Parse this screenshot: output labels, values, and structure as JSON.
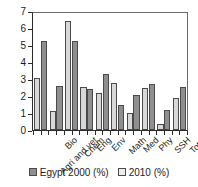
{
  "chart_data": {
    "type": "bar",
    "title": "",
    "subtitle": "",
    "xlabel": "",
    "ylabel": "",
    "ylim": [
      0,
      7
    ],
    "yticks": [
      0,
      1,
      2,
      3,
      4,
      5,
      6,
      7
    ],
    "ytick_labels": [
      "0",
      "1",
      "2",
      "3",
      "4",
      "5",
      "6",
      "7"
    ],
    "grid": false,
    "legend_position": "bottom",
    "categories": [
      "Agri and vet",
      "Bio",
      "Chem",
      "Eng",
      "Env",
      "Math",
      "Med",
      "Phy",
      "SSH",
      "Total"
    ],
    "series": [
      {
        "name": "Egypt 2000 (%)",
        "color": "#d8d8d8",
        "values": [
          3.1,
          1.15,
          6.5,
          2.6,
          2.2,
          2.8,
          1.0,
          2.5,
          0.35,
          1.9
        ]
      },
      {
        "name": "2010 (%)",
        "color": "#8f8f8f",
        "values": [
          5.3,
          2.65,
          5.3,
          2.45,
          3.35,
          1.5,
          2.1,
          2.75,
          1.2,
          2.55
        ]
      }
    ]
  },
  "legend": {
    "items": [
      {
        "label": "Egypt 2000 (%)",
        "swatch": "legend-swatch-egypt-2000"
      },
      {
        "label": "2010 (%)",
        "swatch": "legend-swatch-2010"
      }
    ]
  }
}
